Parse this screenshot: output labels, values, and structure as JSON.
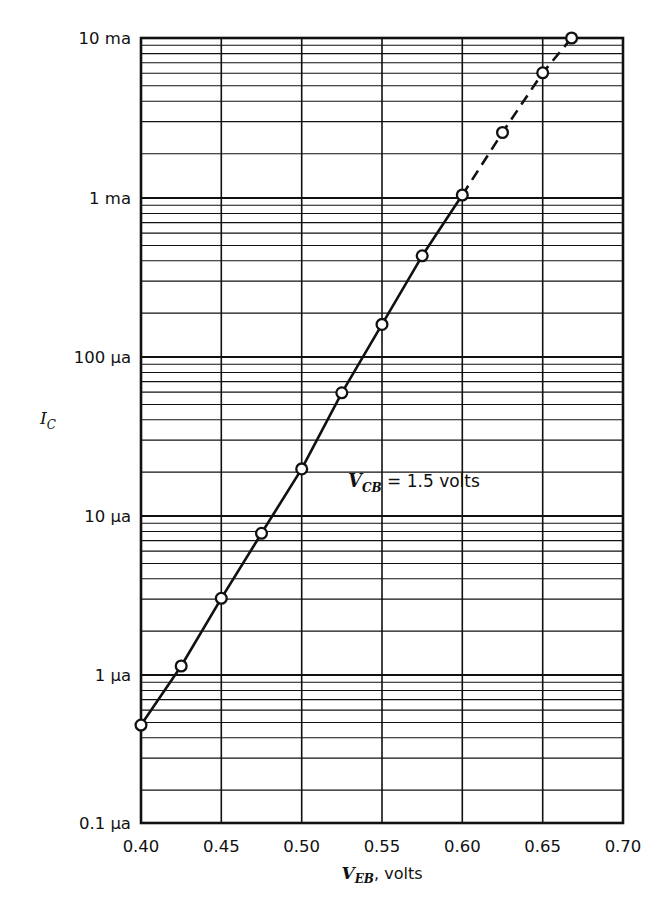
{
  "figure": {
    "background_color": "#ffffff",
    "line_color": "#111111",
    "marker_fill": "#ffffff"
  },
  "annotation": {
    "variable": "V",
    "subscript": "CB",
    "equals_value": " = 1.5 volts",
    "full_text": "V_CB = 1.5 volts",
    "x_value": 0.545,
    "y_value": 30
  },
  "axes": {
    "y_title_main": "I",
    "y_title_sub": "C",
    "y_title_full": "I_C",
    "x_title_main": "V",
    "x_title_sub": "EB",
    "x_title_tail": ", volts",
    "x_title_full": "V_EB, volts"
  },
  "chart_data": {
    "type": "scatter",
    "title": "",
    "subtitle": "",
    "xlabel": "V_EB, volts",
    "ylabel": "I_C",
    "xscale": "linear",
    "yscale": "log",
    "xlim": [
      0.4,
      0.7
    ],
    "ylim": [
      0.1,
      10000
    ],
    "y_unit_note": "values in microamperes (ua); 1000 ua = 1 ma",
    "grid": true,
    "grid_minor_y": true,
    "legend": "none",
    "xticks": [
      0.4,
      0.45,
      0.5,
      0.55,
      0.6,
      0.65,
      0.7
    ],
    "xtick_labels": [
      "0.40",
      "0.45",
      "0.50",
      "0.55",
      "0.60",
      "0.65",
      "0.70"
    ],
    "yticks": [
      0.1,
      1,
      10,
      100,
      1000,
      10000
    ],
    "ytick_labels": [
      "0.1 μa",
      "1 μa",
      "10 μa",
      "100 μa",
      "1 ma",
      "10 ma"
    ],
    "series": [
      {
        "name": "I_C vs V_EB (measured)",
        "linestyle": "solid",
        "marker": "open-circle",
        "x": [
          0.4,
          0.425,
          0.45,
          0.475,
          0.5,
          0.525,
          0.55,
          0.575,
          0.6
        ],
        "y": [
          0.42,
          1.0,
          2.7,
          7.0,
          18,
          55,
          150,
          410,
          1000
        ]
      },
      {
        "name": "I_C vs V_EB (extrapolated)",
        "linestyle": "dashed",
        "marker": "open-circle",
        "x": [
          0.6,
          0.625,
          0.65,
          0.668
        ],
        "y": [
          1000,
          2500,
          6000,
          10000
        ]
      }
    ],
    "annotations": [
      {
        "text": "V_CB = 1.5 volts",
        "x": 0.545,
        "y": 30
      }
    ]
  }
}
